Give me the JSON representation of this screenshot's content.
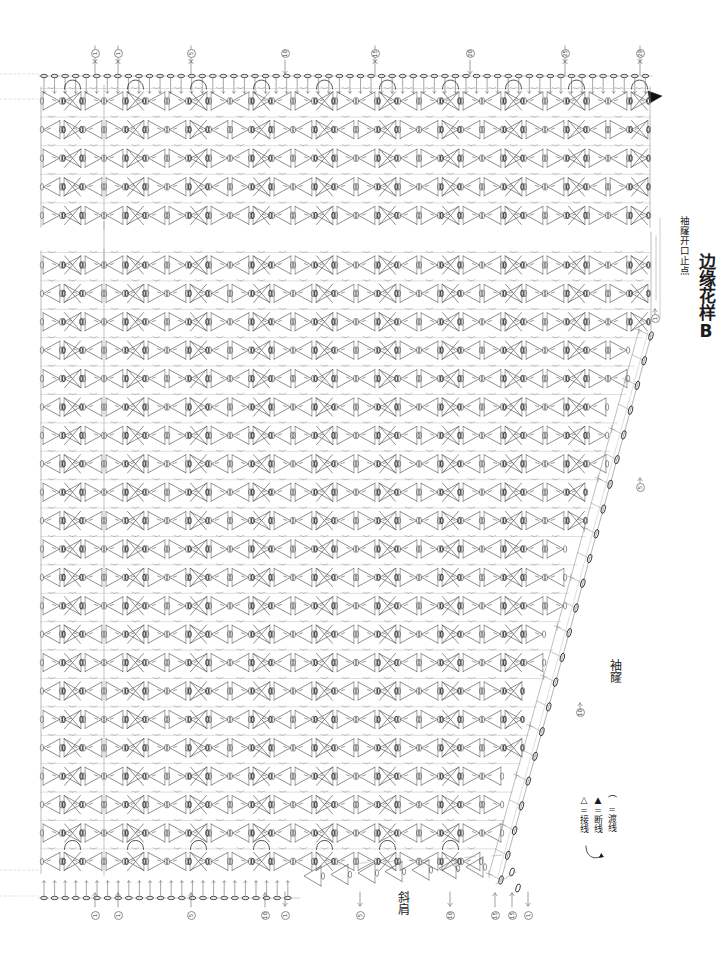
{
  "doc": {
    "kind": "crochet-chart",
    "background": "#ffffff",
    "ink": "#4a4a4a",
    "ink_dark": "#1b1b1b",
    "width": 717,
    "height": 970
  },
  "labels": {
    "edge_pattern_b": "边缘花样B",
    "armhole_opening_stop": "袖窿开口止点",
    "armhole": "袖窿",
    "shoulder_slope": "斜肩"
  },
  "legend": {
    "title": "",
    "rows": [
      {
        "symbol": "△",
        "eq": "=",
        "text": "接线",
        "name": "join-thread"
      },
      {
        "symbol": "▲",
        "eq": "=",
        "text": "断线",
        "name": "cut-thread"
      },
      {
        "symbol": "⌒",
        "eq": "=",
        "text": "渡线",
        "name": "carry-thread"
      }
    ]
  },
  "top_markers": [
    {
      "num": "1",
      "x": 95,
      "dir": "up"
    },
    {
      "num": "1",
      "x": 118,
      "dir": "up"
    },
    {
      "num": "5",
      "x": 191,
      "dir": "up"
    },
    {
      "num": "10",
      "x": 285,
      "dir": "down"
    },
    {
      "num": "15",
      "x": 375,
      "dir": "up"
    },
    {
      "num": "20",
      "x": 470,
      "dir": "down"
    },
    {
      "num": "25",
      "x": 565,
      "dir": "up"
    },
    {
      "num": "29",
      "x": 640,
      "dir": "up"
    }
  ],
  "bottom_markers": [
    {
      "num": "1",
      "x": 95,
      "dir": "up"
    },
    {
      "num": "1",
      "x": 118,
      "dir": "up"
    },
    {
      "num": "5",
      "x": 191,
      "dir": "up"
    },
    {
      "num": "10",
      "x": 265,
      "dir": "up"
    },
    {
      "num": "1",
      "x": 285,
      "dir": "down"
    },
    {
      "num": "5",
      "x": 360,
      "dir": "down"
    },
    {
      "num": "10",
      "x": 450,
      "dir": "down"
    },
    {
      "num": "15",
      "x": 495,
      "dir": "up"
    },
    {
      "num": "15",
      "x": 512,
      "dir": "up"
    },
    {
      "num": "1",
      "x": 528,
      "dir": "down"
    }
  ],
  "side_markers": [
    {
      "num": "1",
      "x": 655,
      "y": 318,
      "dir": "up"
    },
    {
      "num": "5",
      "x": 640,
      "y": 487,
      "dir": "up"
    },
    {
      "num": "10",
      "x": 580,
      "y": 712,
      "dir": "up"
    }
  ],
  "chart_data": {
    "type": "diagram",
    "sections": [
      {
        "name": "yoke-top",
        "x": 40,
        "y": 70,
        "w": 610,
        "h": 150,
        "rows": 5,
        "cols": 29
      },
      {
        "name": "body-main",
        "x": 40,
        "y": 258,
        "w": 610,
        "h": 630,
        "rows": 22,
        "cols": 29
      },
      {
        "name": "edge-pattern-b",
        "x": 500,
        "y": 330,
        "w": 150,
        "h": 560
      }
    ],
    "grid": {
      "col_spacing": 21,
      "row_spacing": 28.4
    }
  }
}
